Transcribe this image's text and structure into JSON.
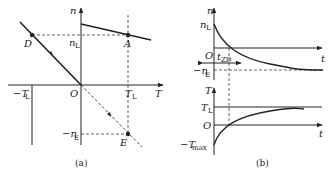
{
  "panel_a": {
    "caption": "(a)",
    "axis_y": "n",
    "axis_x": "T",
    "origin": "O",
    "labels": {
      "nL": "n",
      "nL_sub": "L",
      "TL": "T",
      "TL_sub": "L",
      "negTL": "−T",
      "negTL_sub": "L",
      "negnE": "−n",
      "negnE_sub": "E",
      "A": "A",
      "D": "D",
      "E": "E"
    }
  },
  "panel_b": {
    "caption": "(b)",
    "top": {
      "axis_y": "n",
      "axis_x": "t",
      "origin": "O",
      "nL": "n",
      "nL_sub": "L",
      "negnE": "−n",
      "negnE_sub": "E",
      "tzd": "t",
      "tzd_sub": "ZD"
    },
    "bottom": {
      "axis_y": "T",
      "axis_x": "t",
      "origin": "O",
      "TL": "T",
      "TL_sub": "L",
      "negTmax": "−T",
      "negTmax_sub": "max"
    }
  }
}
